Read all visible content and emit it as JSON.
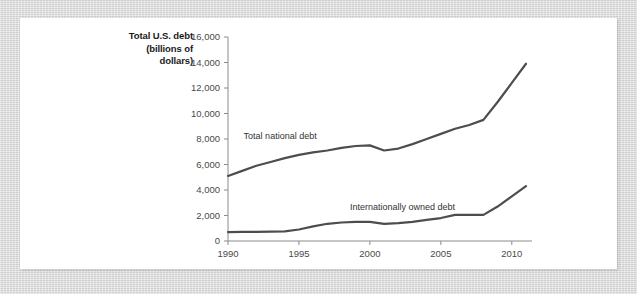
{
  "figure": {
    "background_color": "#ffffff",
    "mat_color": "#d6d6d6",
    "line_color": "#4d4d4d",
    "axis_color": "#8c8c8c",
    "text_color": "#4a4a4a"
  },
  "axis_title": {
    "line1": "Total U.S. debt",
    "line2": "(billions of",
    "line3": "dollars)"
  },
  "chart_data": {
    "type": "line",
    "title": "",
    "subtitle": "",
    "xlabel": "",
    "ylabel": "Total U.S. debt (billions of dollars)",
    "xlim": [
      1990,
      2011
    ],
    "ylim": [
      0,
      16000
    ],
    "grid": false,
    "legend_position": "inline-annotation",
    "xticks": [
      1990,
      1995,
      2000,
      2005,
      2010
    ],
    "xtick_labels": [
      "1990",
      "1995",
      "2000",
      "2005",
      "2010"
    ],
    "yticks": [
      0,
      2000,
      4000,
      6000,
      8000,
      10000,
      12000,
      14000,
      16000
    ],
    "ytick_labels": [
      "0",
      "2,000",
      "4,000",
      "6,000",
      "8,000",
      "10,000",
      "12,000",
      "14,000",
      "16,000"
    ],
    "x": [
      1990,
      1991,
      1992,
      1993,
      1994,
      1995,
      1996,
      1997,
      1998,
      1999,
      2000,
      2001,
      2002,
      2003,
      2004,
      2005,
      2006,
      2007,
      2008,
      2009,
      2010,
      2011
    ],
    "series": [
      {
        "name": "Total national debt",
        "label": "Total national debt",
        "label_x": 1991.1,
        "label_y": 8000,
        "color": "#4d4d4d",
        "values": [
          5100,
          5500,
          5900,
          6200,
          6500,
          6750,
          6950,
          7100,
          7300,
          7450,
          7500,
          7100,
          7250,
          7600,
          8000,
          8400,
          8800,
          9100,
          9500,
          10900,
          12400,
          13900
        ]
      },
      {
        "name": "Internationally owned debt",
        "label": "Internationally owned debt",
        "label_x": 1998.6,
        "label_y": 2450,
        "color": "#4d4d4d",
        "values": [
          700,
          710,
          720,
          730,
          760,
          900,
          1150,
          1350,
          1450,
          1500,
          1500,
          1350,
          1400,
          1500,
          1650,
          1800,
          2050,
          2050,
          2050,
          2700,
          3500,
          4300
        ]
      }
    ]
  }
}
